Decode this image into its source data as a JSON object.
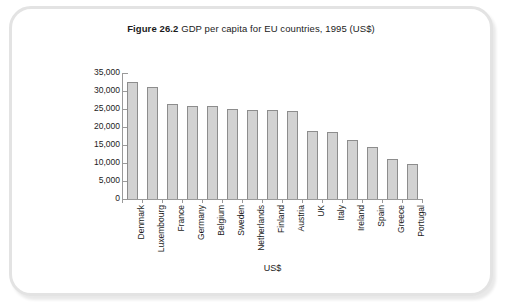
{
  "figure": {
    "number": "Figure 26.2",
    "caption": "GDP per capita for EU countries, 1995 (US$)"
  },
  "colors": {
    "bar_fill": "#d2d2d2",
    "bar_border": "#8d8d8d",
    "axis": "#9a9a9a",
    "frame": "#e3e3e3",
    "text": "#1b1b1b"
  },
  "chart_data": {
    "type": "bar",
    "title": "Figure 26.2 GDP per capita for EU countries, 1995 (US$)",
    "xlabel": "US$",
    "ylabel": "",
    "ylim": [
      0,
      35000
    ],
    "ytick_values": [
      35000,
      30000,
      25000,
      20000,
      15000,
      10000,
      5000,
      0
    ],
    "ytick_labels": [
      "35,000",
      "30,000",
      "25,000",
      "20,000",
      "15,000",
      "10,000",
      "5,000",
      "0"
    ],
    "grid": false,
    "legend": null,
    "orientation": "vertical",
    "categories": [
      "Denmark",
      "Luxembourg",
      "France",
      "Germany",
      "Belgium",
      "Sweden",
      "Netherlands",
      "Finland",
      "Austria",
      "UK",
      "Italy",
      "Ireland",
      "Spain",
      "Greece",
      "Portugal"
    ],
    "values": [
      32500,
      31000,
      26500,
      25800,
      25700,
      25000,
      24800,
      24700,
      24500,
      19000,
      18500,
      16500,
      14500,
      11000,
      9800
    ]
  }
}
